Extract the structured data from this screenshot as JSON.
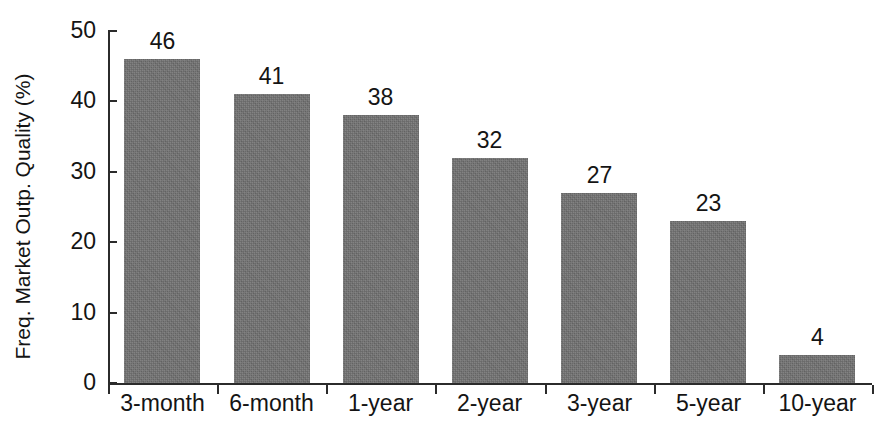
{
  "chart_data": {
    "type": "bar",
    "title": "",
    "subtitle": "",
    "xlabel": "",
    "ylabel": "Freq. Market Outp. Quality (%)",
    "categories": [
      "3-month",
      "6-month",
      "1-year",
      "2-year",
      "3-year",
      "5-year",
      "10-year"
    ],
    "values": [
      46,
      41,
      38,
      32,
      27,
      23,
      4
    ],
    "data_labels": [
      "46",
      "41",
      "38",
      "32",
      "27",
      "23",
      "4"
    ],
    "ylim": [
      0,
      50
    ],
    "yticks": [
      0,
      10,
      20,
      30,
      40,
      50
    ],
    "ytick_labels": [
      "0",
      "10",
      "20",
      "30",
      "40",
      "50"
    ],
    "grid": false,
    "legend": null,
    "legend_position": "none",
    "series": [
      {
        "name": "Freq. Market Outp. Quality (%)",
        "values": [
          46,
          41,
          38,
          32,
          27,
          23,
          4
        ],
        "color": "#6f6f6f"
      }
    ],
    "annotations": []
  },
  "colors": {
    "bar_fill": "#6f6f6f",
    "axis": "#2b2b2b",
    "text": "#141414",
    "background": "#ffffff"
  }
}
